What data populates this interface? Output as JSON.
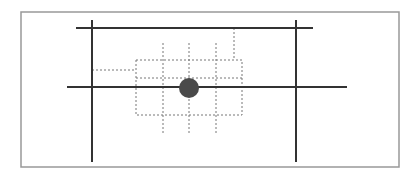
{
  "diagram": {
    "type": "grid-alignment-diagram",
    "colors": {
      "frame": "#999999",
      "solid_line": "#333333",
      "dotted_line": "#777777",
      "marker": "#4a4a4a",
      "background": "#ffffff"
    },
    "frame": {
      "x": 21,
      "y": 12,
      "w": 378,
      "h": 155
    },
    "solid_lines": [
      {
        "id": "top-horizontal",
        "x1": 76,
        "y1": 28,
        "x2": 313,
        "y2": 28
      },
      {
        "id": "middle-horizontal",
        "x1": 67,
        "y1": 87,
        "x2": 347,
        "y2": 87
      },
      {
        "id": "left-vertical",
        "x1": 92,
        "y1": 20,
        "x2": 92,
        "y2": 162
      },
      {
        "id": "right-vertical",
        "x1": 296,
        "y1": 20,
        "x2": 296,
        "y2": 162
      }
    ],
    "dotted_box": {
      "x": 136,
      "y": 60,
      "w": 106,
      "h": 55
    },
    "dotted_lines": [
      {
        "id": "box-inner-horizontal",
        "x1": 136,
        "y1": 78,
        "x2": 242,
        "y2": 78
      },
      {
        "id": "grid-v1",
        "x1": 163,
        "y1": 43,
        "x2": 163,
        "y2": 135
      },
      {
        "id": "grid-v2",
        "x1": 189,
        "y1": 43,
        "x2": 189,
        "y2": 135
      },
      {
        "id": "grid-v3",
        "x1": 216,
        "y1": 43,
        "x2": 216,
        "y2": 135
      },
      {
        "id": "connector-top-right",
        "x1": 234,
        "y1": 28,
        "x2": 234,
        "y2": 60
      },
      {
        "id": "connector-left",
        "x1": 92,
        "y1": 70,
        "x2": 136,
        "y2": 70
      }
    ],
    "marker": {
      "cx": 189,
      "cy": 88,
      "r": 10
    }
  }
}
